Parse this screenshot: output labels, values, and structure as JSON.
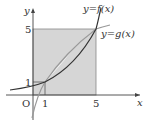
{
  "diagram": {
    "axes": {
      "x_label": "x",
      "y_label": "y",
      "origin_label": "O"
    },
    "ticks": {
      "x": [
        "1",
        "5"
      ],
      "y": [
        "1",
        "5"
      ]
    },
    "curves": [
      {
        "name": "f",
        "label": "y=f(x)",
        "color": "#333333"
      },
      {
        "name": "g",
        "label": "y=g(x)",
        "color": "#999999"
      }
    ],
    "intersections": [
      [
        1,
        1
      ],
      [
        5,
        5
      ]
    ],
    "shaded_region": {
      "description": "square 0≤x≤5, 0≤y≤5 excluding region between curves",
      "color": "#d6d6d6"
    }
  }
}
